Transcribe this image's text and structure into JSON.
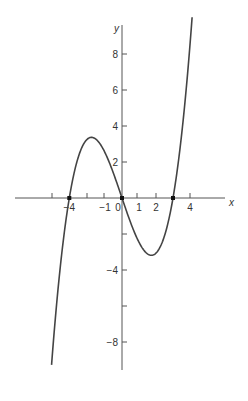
{
  "chart_data": {
    "type": "line",
    "title": "",
    "xlabel": "x",
    "ylabel": "y",
    "xlim": [
      -6.3,
      6.0
    ],
    "ylim": [
      -9.5,
      10.5
    ],
    "grid": false,
    "legend": null,
    "x_ticks": [
      -4,
      -3,
      -2,
      -1,
      1,
      2,
      3,
      4
    ],
    "x_tick_labels": [
      {
        "value": -3.1,
        "label": "−4"
      },
      {
        "value": -1,
        "label": "−1"
      },
      {
        "value": 0,
        "label": "0"
      },
      {
        "value": 1,
        "label": "1"
      },
      {
        "value": 2,
        "label": "2"
      },
      {
        "value": 4,
        "label": "4"
      }
    ],
    "y_ticks": [
      -8,
      -6,
      -4,
      -2,
      2,
      4,
      6,
      8
    ],
    "y_tick_labels": [
      {
        "value": 8,
        "label": "8"
      },
      {
        "value": 6,
        "label": "6"
      },
      {
        "value": 4,
        "label": "4"
      },
      {
        "value": 2,
        "label": "2"
      },
      {
        "value": -4,
        "label": "−4"
      },
      {
        "value": -8,
        "label": "−8"
      }
    ],
    "series": [
      {
        "name": "cubic curve",
        "description": "cubic polynomial with three real roots; local max near (-1.9, 3.4), local min near (1.6, -3.5)",
        "roots": [
          -3.1,
          0,
          3.0
        ],
        "coefficient": 0.3,
        "x_range": [
          -4.71,
          4.35
        ],
        "points": [
          {
            "x": -4.71,
            "y": -10.2
          },
          {
            "x": -3.1,
            "y": 0
          },
          {
            "x": -1.9,
            "y": 3.4
          },
          {
            "x": 0,
            "y": 0
          },
          {
            "x": 1.6,
            "y": -3.5
          },
          {
            "x": 3.0,
            "y": 0
          },
          {
            "x": 4.35,
            "y": 10.4
          }
        ]
      }
    ],
    "marked_points": [
      {
        "x": -3.1,
        "y": 0
      },
      {
        "x": 0,
        "y": 0
      },
      {
        "x": 3.0,
        "y": 0
      }
    ]
  },
  "labels": {
    "x_axis": "x",
    "y_axis": "y"
  }
}
